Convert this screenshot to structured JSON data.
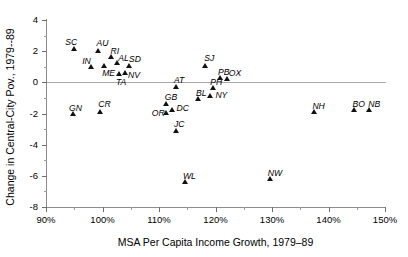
{
  "chart_data": {
    "type": "scatter",
    "title": "",
    "xlabel": "MSA Per Capita Income Growth, 1979–89",
    "ylabel": "Change in Central-City Pov., 1979--89",
    "xlim": [
      90,
      150
    ],
    "ylim": [
      -8,
      4
    ],
    "x_tick_labels": [
      "90%",
      "100%",
      "110%",
      "120%",
      "130%",
      "140%",
      "150%"
    ],
    "x_ticks": [
      90,
      100,
      110,
      120,
      130,
      140,
      150
    ],
    "x_minor_ticks": [
      95,
      105,
      115,
      125,
      135,
      145
    ],
    "y_tick_labels": [
      "4",
      "2",
      "0",
      "-2",
      "-4",
      "-6",
      "-8"
    ],
    "y_ticks": [
      4,
      2,
      0,
      -2,
      -4,
      -6,
      -8
    ],
    "y_minor_ticks": [
      3,
      1,
      -1,
      -3,
      -5,
      -7
    ],
    "grid": false,
    "legend": "none",
    "zero_reference_line": 0,
    "marker": "triangle",
    "marker_color": "#111111",
    "points": [
      {
        "label": "SC",
        "x": 95.0,
        "y": 2.15,
        "lx": -9,
        "ly": -11
      },
      {
        "label": "AU",
        "x": 99.3,
        "y": 2.05,
        "lx": -2,
        "ly": -11
      },
      {
        "label": "RI",
        "x": 101.6,
        "y": 1.65,
        "lx": -1,
        "ly": -10
      },
      {
        "label": "IN",
        "x": 98.0,
        "y": 1.0,
        "lx": -9,
        "ly": -10
      },
      {
        "label": "ME",
        "x": 100.3,
        "y": 1.1,
        "lx": -2,
        "ly": 4
      },
      {
        "label": "AL",
        "x": 102.6,
        "y": 1.25,
        "lx": 1,
        "ly": -9
      },
      {
        "label": "SD",
        "x": 104.7,
        "y": 1.1,
        "lx": 0,
        "ly": -10
      },
      {
        "label": "NV",
        "x": 104.0,
        "y": 0.6,
        "lx": 3,
        "ly": -2
      },
      {
        "label": "TA",
        "x": 102.9,
        "y": 0.55,
        "lx": -3,
        "ly": 4
      },
      {
        "label": "SJ",
        "x": 118.2,
        "y": 1.1,
        "lx": -1,
        "ly": -11
      },
      {
        "label": "AT",
        "x": 113.0,
        "y": -0.25,
        "lx": -2,
        "ly": -10
      },
      {
        "label": "PH",
        "x": 119.6,
        "y": -0.35,
        "lx": -3,
        "ly": -10
      },
      {
        "label": "PB",
        "x": 120.8,
        "y": 0.3,
        "lx": -2,
        "ly": -10
      },
      {
        "label": "OX",
        "x": 122.0,
        "y": 0.25,
        "lx": 2,
        "ly": -9
      },
      {
        "label": "NY",
        "x": 119.1,
        "y": -0.85,
        "lx": 5,
        "ly": -5
      },
      {
        "label": "BL",
        "x": 116.9,
        "y": -1.05,
        "lx": -2,
        "ly": -10
      },
      {
        "label": "GB",
        "x": 111.2,
        "y": -1.35,
        "lx": -1,
        "ly": -10
      },
      {
        "label": "DC",
        "x": 112.4,
        "y": -1.75,
        "lx": 4,
        "ly": -6
      },
      {
        "label": "OR",
        "x": 111.2,
        "y": -1.95,
        "lx": -14,
        "ly": -4
      },
      {
        "label": "GN",
        "x": 94.8,
        "y": -2.0,
        "lx": -4,
        "ly": -10
      },
      {
        "label": "CR",
        "x": 99.6,
        "y": -1.85,
        "lx": -2,
        "ly": -11
      },
      {
        "label": "JC",
        "x": 113.0,
        "y": -3.1,
        "lx": -2,
        "ly": -11
      },
      {
        "label": "NH",
        "x": 137.5,
        "y": -1.9,
        "lx": -2,
        "ly": -10
      },
      {
        "label": "BO",
        "x": 144.6,
        "y": -1.75,
        "lx": -2,
        "ly": -10
      },
      {
        "label": "NB",
        "x": 147.2,
        "y": -1.75,
        "lx": -1,
        "ly": -10
      },
      {
        "label": "WL",
        "x": 114.6,
        "y": -6.4,
        "lx": -2,
        "ly": -10
      },
      {
        "label": "NW",
        "x": 129.6,
        "y": -6.2,
        "lx": -2,
        "ly": -10
      }
    ]
  }
}
